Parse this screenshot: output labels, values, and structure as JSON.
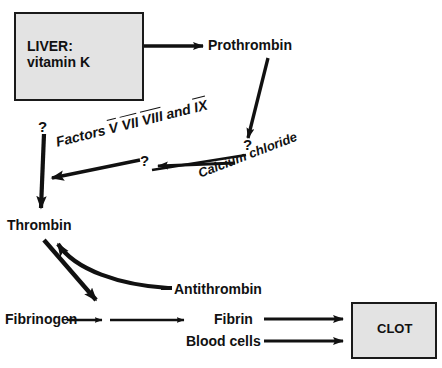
{
  "diagram": {
    "background_color": "#ffffff",
    "stroke_color": "#111111",
    "box_fill_color": "#e3e3e3",
    "nodes": {
      "liver": {
        "line1": "LIVER:",
        "line2": "vitamin K"
      },
      "prothrombin": {
        "label": "Prothrombin"
      },
      "thrombin": {
        "label": "Thrombin"
      },
      "fibrinogen": {
        "label": "Fibrinogen"
      },
      "fibrin": {
        "label": "Fibrin"
      },
      "blood_cells": {
        "label": "Blood cells"
      },
      "antithrombin": {
        "label": "Antithrombin"
      },
      "clot": {
        "label": "CLOT"
      }
    },
    "annotations": {
      "factors_prefix": "Factors ",
      "factor_5": "V",
      "factor_7": "VII",
      "factor_8": "VIII",
      "factors_conjunction": " and ",
      "factor_9": "IX",
      "calcium_chloride": "Calcium chloride",
      "question_left": "?",
      "question_middle": "?",
      "question_right": "?"
    }
  }
}
